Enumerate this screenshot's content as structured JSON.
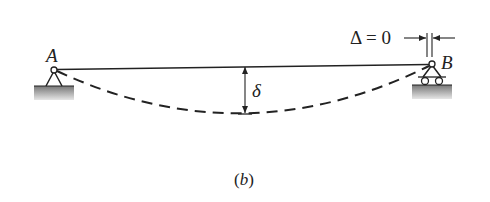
{
  "figure": {
    "caption": "(b)",
    "caption_parts": {
      "open": "(",
      "letter": "b",
      "close": ")"
    },
    "labels": {
      "left_support": "A",
      "right_support": "B",
      "deflection": "δ",
      "horizontal_displacement": "Δ = 0"
    },
    "elements": {
      "beam": "straight undeformed beam from A to B",
      "deflected_shape": "dashed sagging curve",
      "left_support_type": "pin",
      "right_support_type": "roller"
    },
    "colors": {
      "line": "#222222",
      "ground": "#9a9a9a"
    }
  }
}
